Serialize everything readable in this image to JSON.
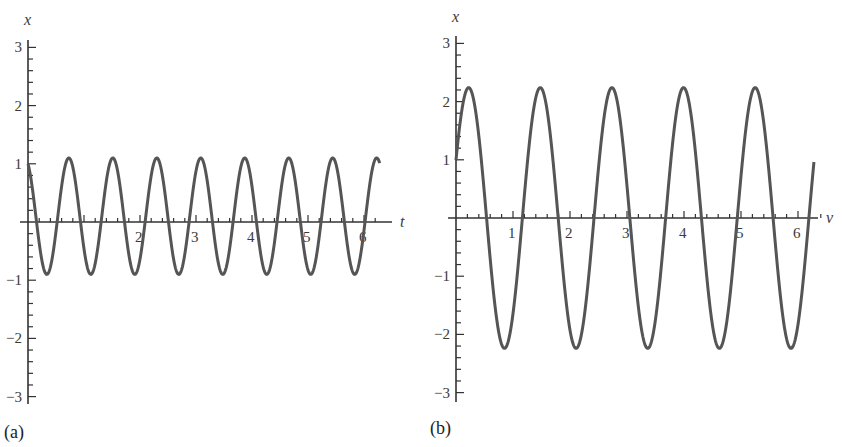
{
  "chart_data": [
    {
      "type": "line",
      "panel_label": "(a)",
      "xlabel": "t",
      "ylabel": "x",
      "xlim": [
        0,
        6.3
      ],
      "ylim": [
        -3,
        3
      ],
      "x_tick_labels": [
        "2",
        "3",
        "4",
        "5",
        "6"
      ],
      "x_ticks": [
        2,
        3,
        4,
        5,
        6
      ],
      "y_tick_labels": [
        "3",
        "2",
        "1",
        "−1",
        "−2",
        "−3"
      ],
      "y_ticks": [
        3,
        2,
        1,
        -1,
        -2,
        -3
      ],
      "minor_ticks_per_unit": 5,
      "grid": false,
      "series": [
        {
          "name": "x(t)",
          "description": "sinusoid, 8 cycles over 0..2pi, offset +0.1, amplitude 1.0, starts at x=1 decreasing",
          "function": {
            "offset": 0.1,
            "amplitude": 1.0,
            "omega": 8,
            "phase": 0.45,
            "kind": "cos"
          },
          "x": [
            0,
            0.39,
            0.73,
            1.12,
            1.51,
            1.9,
            2.3,
            2.69,
            3.08,
            3.47,
            3.87,
            4.26,
            4.65,
            5.04,
            5.43,
            5.83,
            6.22,
            6.28
          ],
          "values": [
            1.0,
            -0.9,
            1.1,
            -0.9,
            1.1,
            -0.9,
            1.1,
            -0.9,
            1.1,
            -0.9,
            1.1,
            -0.9,
            1.1,
            -0.9,
            1.1,
            -0.9,
            1.1,
            1.1
          ]
        }
      ]
    },
    {
      "type": "line",
      "panel_label": "(b)",
      "xlabel": "v",
      "ylabel": "x",
      "xlim": [
        0,
        6.4
      ],
      "ylim": [
        -3,
        3
      ],
      "x_tick_labels": [
        "1",
        "2",
        "3",
        "4",
        "5",
        "6"
      ],
      "x_ticks": [
        1,
        2,
        3,
        4,
        5,
        6
      ],
      "y_tick_labels": [
        "3",
        "2",
        "1",
        "−1",
        "−2",
        "−3"
      ],
      "y_ticks": [
        3,
        2,
        1,
        -1,
        -2,
        -3
      ],
      "minor_ticks_per_unit": 5,
      "grid": false,
      "series": [
        {
          "name": "x(v)",
          "description": "sinusoid, 5 cycles over 0..2pi, amplitude ~2.24, starts at x=1 increasing",
          "function": {
            "offset": 0,
            "amplitude": 2.24,
            "omega": 5,
            "phase": 0.46,
            "kind": "sin"
          },
          "x": [
            0,
            0.22,
            0.84,
            1.47,
            2.1,
            2.73,
            3.35,
            3.98,
            4.61,
            5.24,
            5.86,
            6.28
          ],
          "values": [
            1.0,
            2.24,
            -2.24,
            2.24,
            -2.24,
            2.24,
            -2.24,
            2.24,
            -2.24,
            2.24,
            -2.24,
            1.0
          ]
        }
      ]
    }
  ],
  "panels": {
    "a": {
      "label": "(a)",
      "x_axis_name": "t",
      "y_axis_name": "x"
    },
    "b": {
      "label": "(b)",
      "x_axis_name": "v",
      "y_axis_name": "x"
    }
  },
  "colors": {
    "curve": "#555555",
    "axis": "#333333",
    "text": "#333333"
  }
}
